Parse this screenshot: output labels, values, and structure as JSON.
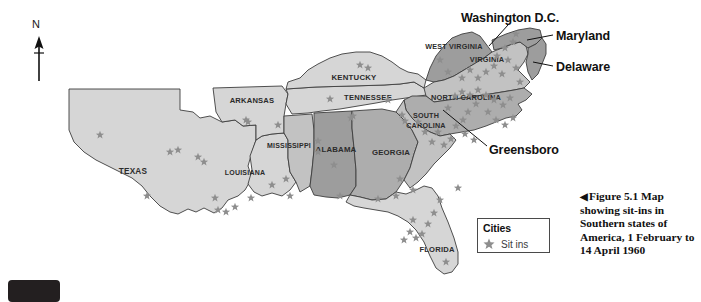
{
  "figure": {
    "caption_arrow": "◀",
    "caption_text": "Figure 5.1 Map showing sit-ins in Southern states of America, 1 February to 14 April 1960"
  },
  "compass": {
    "north_label": "N"
  },
  "legend": {
    "title": "Cities",
    "star_symbol": "★",
    "entry_label": "Sit ins"
  },
  "callouts": [
    {
      "name": "washington-dc",
      "label": "Washington D.C."
    },
    {
      "name": "maryland",
      "label": "Maryland"
    },
    {
      "name": "delaware",
      "label": "Delaware"
    },
    {
      "name": "greensboro",
      "label": "Greensboro"
    }
  ],
  "colors": {
    "state_light": "#d6d6d6",
    "state_mid": "#c2c2c2",
    "state_dark": "#adadad",
    "state_darker": "#9d9d9d",
    "border": "#3d3d3d",
    "star": "#8e8e8e",
    "background": "#ffffff",
    "text": "#111111"
  },
  "map": {
    "states": [
      {
        "name": "texas",
        "label": "Texas",
        "shade": "light",
        "label_x": 133,
        "label_y": 174,
        "label_size": 8.2
      },
      {
        "name": "arkansas",
        "label": "Arkansas",
        "shade": "light",
        "label_x": 252,
        "label_y": 103,
        "label_size": 7.6
      },
      {
        "name": "louisiana",
        "label": "Louisiana",
        "shade": "light",
        "label_x": 245,
        "label_y": 175,
        "label_size": 7.0
      },
      {
        "name": "mississippi",
        "label": "Mississippi",
        "shade": "mid",
        "label_x": 289,
        "label_y": 148,
        "label_size": 7.0
      },
      {
        "name": "alabama",
        "label": "Alabama",
        "shade": "darker",
        "label_x": 336,
        "label_y": 152,
        "label_size": 7.8
      },
      {
        "name": "georgia",
        "label": "Georgia",
        "shade": "dark",
        "label_x": 391,
        "label_y": 155,
        "label_size": 7.8
      },
      {
        "name": "florida",
        "label": "Florida",
        "shade": "light",
        "label_x": 437,
        "label_y": 252,
        "label_size": 7.6
      },
      {
        "name": "tennessee",
        "label": "Tennessee",
        "shade": "light",
        "label_x": 368,
        "label_y": 100,
        "label_size": 7.6
      },
      {
        "name": "kentucky",
        "label": "Kentucky",
        "shade": "light",
        "label_x": 354,
        "label_y": 80,
        "label_size": 7.8
      },
      {
        "name": "west-virginia",
        "label": "West Virginia",
        "shade": "darker",
        "label_x": 454,
        "label_y": 49,
        "label_size": 7.2
      },
      {
        "name": "virginia",
        "label": "Virginia",
        "shade": "mid",
        "label_x": 487,
        "label_y": 62,
        "label_size": 7.4
      },
      {
        "name": "north-carolina",
        "label": "North Carolina",
        "shade": "dark",
        "label_x": 466,
        "label_y": 100,
        "label_size": 7.4
      },
      {
        "name": "south-carolina",
        "label": "South Carolina",
        "shade": "mid",
        "label_x": 426,
        "label_y": 122,
        "label_size": 7.2
      },
      {
        "name": "maryland",
        "label": "",
        "shade": "darker",
        "label_x": 0,
        "label_y": 0,
        "label_size": 0
      },
      {
        "name": "delaware",
        "label": "",
        "shade": "darker",
        "label_x": 0,
        "label_y": 0,
        "label_size": 0
      }
    ],
    "sit_in_markers": [
      {
        "x": 100,
        "y": 135
      },
      {
        "x": 170,
        "y": 152
      },
      {
        "x": 178,
        "y": 150
      },
      {
        "x": 147,
        "y": 196
      },
      {
        "x": 198,
        "y": 157
      },
      {
        "x": 204,
        "y": 162
      },
      {
        "x": 215,
        "y": 198
      },
      {
        "x": 218,
        "y": 210
      },
      {
        "x": 226,
        "y": 212
      },
      {
        "x": 235,
        "y": 207
      },
      {
        "x": 246,
        "y": 120
      },
      {
        "x": 248,
        "y": 122
      },
      {
        "x": 272,
        "y": 185
      },
      {
        "x": 251,
        "y": 198
      },
      {
        "x": 290,
        "y": 196
      },
      {
        "x": 278,
        "y": 125
      },
      {
        "x": 286,
        "y": 179
      },
      {
        "x": 318,
        "y": 141
      },
      {
        "x": 334,
        "y": 165
      },
      {
        "x": 340,
        "y": 196
      },
      {
        "x": 318,
        "y": 152
      },
      {
        "x": 353,
        "y": 116
      },
      {
        "x": 351,
        "y": 118
      },
      {
        "x": 360,
        "y": 65
      },
      {
        "x": 368,
        "y": 68
      },
      {
        "x": 330,
        "y": 99
      },
      {
        "x": 388,
        "y": 100
      },
      {
        "x": 402,
        "y": 115
      },
      {
        "x": 396,
        "y": 196
      },
      {
        "x": 400,
        "y": 179
      },
      {
        "x": 413,
        "y": 190
      },
      {
        "x": 405,
        "y": 121
      },
      {
        "x": 418,
        "y": 122
      },
      {
        "x": 425,
        "y": 132
      },
      {
        "x": 438,
        "y": 132
      },
      {
        "x": 432,
        "y": 142
      },
      {
        "x": 444,
        "y": 145
      },
      {
        "x": 451,
        "y": 139
      },
      {
        "x": 456,
        "y": 126
      },
      {
        "x": 463,
        "y": 120
      },
      {
        "x": 468,
        "y": 112
      },
      {
        "x": 448,
        "y": 108
      },
      {
        "x": 455,
        "y": 96
      },
      {
        "x": 462,
        "y": 92
      },
      {
        "x": 470,
        "y": 95
      },
      {
        "x": 478,
        "y": 90
      },
      {
        "x": 486,
        "y": 95
      },
      {
        "x": 494,
        "y": 100
      },
      {
        "x": 503,
        "y": 105
      },
      {
        "x": 510,
        "y": 98
      },
      {
        "x": 476,
        "y": 104
      },
      {
        "x": 488,
        "y": 112
      },
      {
        "x": 496,
        "y": 120
      },
      {
        "x": 505,
        "y": 125
      },
      {
        "x": 513,
        "y": 118
      },
      {
        "x": 465,
        "y": 134
      },
      {
        "x": 474,
        "y": 140
      },
      {
        "x": 440,
        "y": 60
      },
      {
        "x": 448,
        "y": 72
      },
      {
        "x": 462,
        "y": 78
      },
      {
        "x": 470,
        "y": 70
      },
      {
        "x": 478,
        "y": 78
      },
      {
        "x": 486,
        "y": 72
      },
      {
        "x": 494,
        "y": 66
      },
      {
        "x": 502,
        "y": 74
      },
      {
        "x": 497,
        "y": 56
      },
      {
        "x": 505,
        "y": 48
      },
      {
        "x": 513,
        "y": 42
      },
      {
        "x": 516,
        "y": 34
      },
      {
        "x": 508,
        "y": 60
      },
      {
        "x": 516,
        "y": 68
      },
      {
        "x": 520,
        "y": 82
      },
      {
        "x": 440,
        "y": 200
      },
      {
        "x": 434,
        "y": 213
      },
      {
        "x": 428,
        "y": 224
      },
      {
        "x": 422,
        "y": 234
      },
      {
        "x": 416,
        "y": 238
      },
      {
        "x": 410,
        "y": 232
      },
      {
        "x": 413,
        "y": 220
      },
      {
        "x": 404,
        "y": 240
      },
      {
        "x": 446,
        "y": 262
      },
      {
        "x": 378,
        "y": 199
      },
      {
        "x": 458,
        "y": 188
      }
    ]
  }
}
